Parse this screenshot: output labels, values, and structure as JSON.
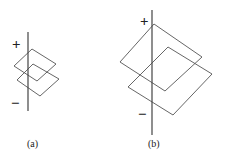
{
  "figure": {
    "panels": [
      {
        "label": "(a)",
        "plus": "+",
        "minus": "−"
      },
      {
        "label": "(b)",
        "plus": "+",
        "minus": "−"
      }
    ]
  }
}
